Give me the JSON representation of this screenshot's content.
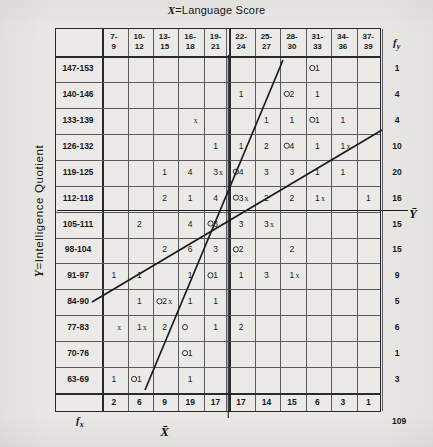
{
  "chart_data": {
    "type": "heatmap",
    "title": "X=Language Score",
    "xlabel": "X=Language Score",
    "ylabel": "Y=Intelligence Quotient",
    "x_mean_label": "X̄",
    "y_mean_label": "Ȳ",
    "grid": true,
    "legend": "none",
    "categories": [
      "7-9",
      "10-12",
      "13-15",
      "16-18",
      "19-21",
      "22-24",
      "25-27",
      "28-30",
      "31-33",
      "34-36",
      "37-39"
    ],
    "row_categories": [
      "147-153",
      "140-146",
      "133-139",
      "126-132",
      "119-125",
      "112-118",
      "105-111",
      "98-104",
      "91-97",
      "84-90",
      "77-83",
      "70-76",
      "63-69"
    ],
    "column_totals": [
      2,
      6,
      9,
      19,
      17,
      17,
      14,
      15,
      6,
      3,
      1
    ],
    "row_totals": [
      1,
      4,
      4,
      10,
      20,
      16,
      15,
      15,
      9,
      5,
      6,
      1,
      3
    ],
    "grand_total": 109,
    "cells": [
      [
        "",
        "",
        "",
        "",
        "",
        "",
        "",
        "",
        "1",
        "",
        ""
      ],
      [
        "",
        "",
        "",
        "",
        "",
        "1",
        "",
        "2",
        "1",
        "",
        ""
      ],
      [
        "",
        "",
        "",
        "",
        "",
        "",
        "1",
        "1",
        "1",
        "1",
        ""
      ],
      [
        "",
        "",
        "",
        "",
        "1",
        "1",
        "2",
        "4",
        "1",
        "1",
        ""
      ],
      [
        "",
        "",
        "1",
        "4",
        "3",
        "4",
        "3",
        "3",
        "1",
        "1",
        ""
      ],
      [
        "",
        "",
        "2",
        "1",
        "4",
        "3",
        "2",
        "2",
        "1",
        "",
        "1"
      ],
      [
        "",
        "2",
        "",
        "4",
        "3",
        "3",
        "3",
        "",
        "",
        "",
        ""
      ],
      [
        "",
        "",
        "2",
        "6",
        "3",
        "2",
        "",
        "2",
        "",
        "",
        ""
      ],
      [
        "1",
        "1",
        "",
        "1",
        "1",
        "1",
        "3",
        "1",
        "",
        "",
        ""
      ],
      [
        "",
        "1",
        "2",
        "1",
        "1",
        "",
        "",
        "",
        "",
        "",
        ""
      ],
      [
        "",
        "1",
        "2",
        "",
        "1",
        "2",
        "",
        "",
        "",
        "",
        ""
      ],
      [
        "",
        "",
        "",
        "1",
        "",
        "",
        "",
        "",
        "",
        "",
        ""
      ],
      [
        "1",
        "1",
        "",
        "1",
        "",
        "",
        "",
        "",
        "",
        "",
        ""
      ]
    ],
    "circle_marks": [
      {
        "row": 0,
        "col": 8
      },
      {
        "row": 1,
        "col": 7
      },
      {
        "row": 2,
        "col": 8
      },
      {
        "row": 3,
        "col": 7
      },
      {
        "row": 4,
        "col": 5
      },
      {
        "row": 5,
        "col": 5
      },
      {
        "row": 6,
        "col": 4
      },
      {
        "row": 7,
        "col": 5
      },
      {
        "row": 8,
        "col": 4
      },
      {
        "row": 9,
        "col": 2
      },
      {
        "row": 10,
        "col": 3
      },
      {
        "row": 11,
        "col": 3
      },
      {
        "row": 12,
        "col": 1
      }
    ],
    "cross_marks": [
      {
        "col": 3,
        "row": 2
      },
      {
        "col": 4,
        "row": 4
      },
      {
        "col": 5,
        "row": 5
      },
      {
        "col": 6,
        "row": 6
      },
      {
        "col": 7,
        "row": 8
      },
      {
        "col": 2,
        "row": 9
      },
      {
        "col": 1,
        "row": 10
      },
      {
        "col": 0,
        "row": 10
      },
      {
        "col": 8,
        "row": 5
      },
      {
        "col": 9,
        "row": 3
      }
    ],
    "regression_lines": [
      {
        "name": "y-on-x",
        "x1": 92,
        "y1": 302,
        "x2": 382,
        "y2": 130
      },
      {
        "name": "x-on-y",
        "x1": 145,
        "y1": 390,
        "x2": 283,
        "y2": 60
      }
    ]
  },
  "labels": {
    "fy_symbol": "f",
    "fy_sub": "y",
    "fx_symbol": "f",
    "fx_sub": "x",
    "total": "109",
    "x_axis_title_prefix": "X",
    "x_axis_title_rest": "=Language Score",
    "y_axis_title_prefix": "Y",
    "y_axis_title_rest": "=Intelligence Quotient",
    "xbar": "X̄",
    "ybar": "Ȳ"
  },
  "colors": {
    "paper": "#e9e8e4",
    "ink": "#17171b",
    "grid": "#5b5b5f",
    "border": "#2a2a2e"
  }
}
